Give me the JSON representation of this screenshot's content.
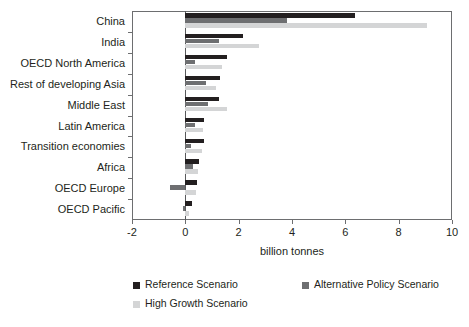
{
  "chart_data": {
    "type": "bar",
    "orientation": "horizontal",
    "title": "",
    "xlabel": "billion tonnes",
    "ylabel": "",
    "xlim": [
      -2,
      10
    ],
    "xticks": [
      "-2",
      "0",
      "2",
      "4",
      "6",
      "8",
      "10"
    ],
    "xtick_values": [
      -2,
      0,
      2,
      4,
      6,
      8,
      10
    ],
    "grid": false,
    "legend_position": "bottom",
    "categories": [
      "China",
      "India",
      "OECD North America",
      "Rest of developing Asia",
      "Middle East",
      "Latin America",
      "Transition economies",
      "Africa",
      "OECD Europe",
      "OECD Pacific"
    ],
    "series": [
      {
        "name": "Reference Scenario",
        "color": "#231f20",
        "values": [
          6.35,
          2.15,
          1.55,
          1.3,
          1.28,
          0.7,
          0.7,
          0.5,
          0.45,
          0.25
        ]
      },
      {
        "name": "Alternative Policy Scenario",
        "color": "#6e6f71",
        "values": [
          3.8,
          1.28,
          0.38,
          0.78,
          0.85,
          0.38,
          0.22,
          0.27,
          -0.57,
          -0.1
        ]
      },
      {
        "name": "High Growth Scenario",
        "color": "#d4d5d6",
        "values": [
          9.05,
          2.78,
          1.38,
          1.15,
          1.55,
          0.67,
          0.63,
          0.47,
          0.4,
          0.12
        ]
      }
    ]
  },
  "legend": {
    "items": [
      {
        "label": "Reference Scenario",
        "color": "#231f20"
      },
      {
        "label": "Alternative Policy Scenario",
        "color": "#6e6f71"
      },
      {
        "label": "High Growth Scenario",
        "color": "#d4d5d6"
      }
    ]
  },
  "axis": {
    "x_title": "billion tonnes"
  }
}
